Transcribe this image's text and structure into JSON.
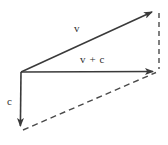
{
  "figure": {
    "width": 168,
    "height": 145,
    "background_color": "#ffffff",
    "stroke_color": "#3a3a3a",
    "dashed_color": "#4a4a4a",
    "text_color": "#2f2f2f"
  },
  "labels": {
    "v": "v",
    "v_plus_c": "v + c",
    "c": "c"
  },
  "label_positions": {
    "v": {
      "x": 74,
      "y": 23
    },
    "v_plus_c": {
      "x": 80,
      "y": 54
    },
    "c": {
      "x": 7,
      "y": 96
    }
  },
  "geometry": {
    "origin": {
      "x": 21,
      "y": 72
    },
    "v_tip": {
      "x": 156,
      "y": 10
    },
    "v_plus_c_tip": {
      "x": 158,
      "y": 71
    },
    "c_tip": {
      "x": 20,
      "y": 131
    },
    "dashed_vertical": {
      "x1": 159,
      "y1": 13,
      "x2": 159,
      "y2": 69
    },
    "dashed_diagonal": {
      "x1": 23,
      "y1": 130,
      "x2": 155,
      "y2": 73
    }
  },
  "chart_data": {
    "type": "diagram",
    "vectors": [
      {
        "name": "v",
        "label": "v",
        "style": "solid",
        "arrow": true,
        "from": {
          "x": 21,
          "y": 72
        },
        "to": {
          "x": 156,
          "y": 10
        }
      },
      {
        "name": "v + c",
        "label": "v + c",
        "style": "solid",
        "arrow": true,
        "from": {
          "x": 21,
          "y": 72
        },
        "to": {
          "x": 158,
          "y": 71
        }
      },
      {
        "name": "c",
        "label": "c",
        "style": "solid",
        "arrow": true,
        "from": {
          "x": 21,
          "y": 72
        },
        "to": {
          "x": 20,
          "y": 131
        }
      }
    ],
    "construction_lines": [
      {
        "name": "v-tip-to-resultant-tip",
        "style": "dashed",
        "arrow": false,
        "from": {
          "x": 159,
          "y": 13
        },
        "to": {
          "x": 159,
          "y": 69
        }
      },
      {
        "name": "c-tip-to-resultant-tip",
        "style": "dashed",
        "arrow": false,
        "from": {
          "x": 23,
          "y": 130
        },
        "to": {
          "x": 155,
          "y": 73
        }
      }
    ],
    "legend": [],
    "xlabel": "",
    "ylabel": ""
  }
}
